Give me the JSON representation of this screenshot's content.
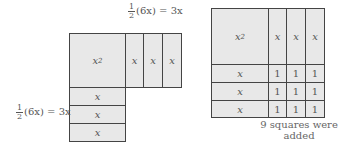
{
  "left_figure": {
    "top_label": {
      "frac_num": "1",
      "frac_den": "2",
      "expr": "(6x) = 3x"
    },
    "side_label": {
      "frac_num": "1",
      "frac_den": "2",
      "expr": "(6x) = 3x"
    },
    "square": {
      "base": "x",
      "exp": "2"
    },
    "right_strips": [
      "x",
      "x",
      "x"
    ],
    "bottom_strips": [
      "x",
      "x",
      "x"
    ]
  },
  "right_figure": {
    "square": {
      "base": "x",
      "exp": "2"
    },
    "top_strips": [
      "x",
      "x",
      "x"
    ],
    "left_strips": [
      "x",
      "x",
      "x"
    ],
    "unit_squares": [
      [
        "1",
        "1",
        "1"
      ],
      [
        "1",
        "1",
        "1"
      ],
      [
        "1",
        "1",
        "1"
      ]
    ],
    "caption_line1": "9 squares were",
    "caption_line2": "added"
  }
}
